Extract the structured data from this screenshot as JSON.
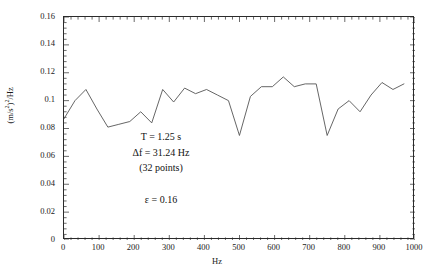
{
  "chart_data": {
    "type": "line",
    "title": "",
    "xlabel": "Hz",
    "ylabel": "(m/s²)²/Hz",
    "xlim": [
      0,
      1000
    ],
    "ylim": [
      0,
      0.16
    ],
    "grid": false,
    "legend": "none",
    "x_ticks": [
      0,
      100,
      200,
      300,
      400,
      500,
      600,
      700,
      800,
      900,
      1000
    ],
    "x_tick_labels": [
      "0",
      "100",
      "200",
      "300",
      "400",
      "500",
      "600",
      "700",
      "800",
      "900",
      "1000"
    ],
    "y_ticks": [
      0,
      0.02,
      0.04,
      0.06,
      0.08,
      0.1,
      0.12,
      0.14,
      0.16
    ],
    "y_tick_labels": [
      "0",
      "0.02",
      "0.04",
      "0.06",
      "0.08",
      "0.1",
      "0.12",
      "0.14",
      "0.16"
    ],
    "minor_ticks": true,
    "line_color": "#555555",
    "series": [
      {
        "name": "PSD",
        "x": [
          0,
          31.24,
          62.48,
          93.72,
          124.96,
          156.2,
          187.44,
          218.68,
          249.92,
          281.16,
          312.4,
          343.64,
          374.88,
          406.12,
          437.36,
          468.6,
          499.84,
          531.08,
          562.32,
          593.56,
          624.8,
          656.04,
          687.28,
          718.52,
          749.76,
          781.0,
          812.24,
          843.48,
          874.72,
          905.96,
          937.2,
          968.44
        ],
        "values": [
          0.087,
          0.1,
          0.108,
          0.094,
          0.081,
          0.083,
          0.085,
          0.092,
          0.084,
          0.108,
          0.099,
          0.109,
          0.105,
          0.108,
          0.104,
          0.1,
          0.075,
          0.103,
          0.11,
          0.11,
          0.117,
          0.11,
          0.112,
          0.112,
          0.075,
          0.094,
          0.1,
          0.092,
          0.104,
          0.113,
          0.108,
          0.112
        ]
      }
    ],
    "annotations": [
      {
        "text": "T = 1.25 s"
      },
      {
        "text": "Δf = 31.24 Hz"
      },
      {
        "text": "(32 points)"
      },
      {
        "text": "ε = 0.16"
      }
    ]
  },
  "axis": {
    "y_title_prefix": "(m/s",
    "y_title_sup": "2",
    "y_title_suffix": ")",
    "y_title_sup2": "2",
    "y_title_end": "/Hz",
    "x_title": "Hz"
  }
}
